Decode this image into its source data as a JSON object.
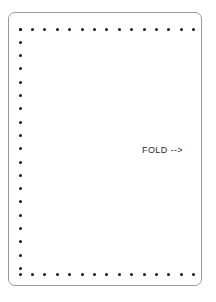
{
  "page": {
    "width": 216,
    "height": 302,
    "background_color": "#ffffff"
  },
  "sheet": {
    "name": "perforated-sheet",
    "fill_color": "#ffffff",
    "border_color": "#9a9a9a",
    "corner_radius": 7,
    "bounds": {
      "x": 8,
      "y": 12,
      "width": 194,
      "height": 274
    }
  },
  "annotation": {
    "fold_label": "FOLD -->",
    "color": "#2b2b2b",
    "position": {
      "x": 142,
      "y": 145
    }
  },
  "perforations": {
    "dot_color": "#1a1a1a",
    "dot_size": 3,
    "edges": {
      "top": {
        "count": 15,
        "y": 29,
        "x_start": 20,
        "x_step": 12.4
      },
      "left": {
        "count": 19,
        "x": 20,
        "y_start": 29,
        "y_step": 13.3
      },
      "bottom": {
        "count": 15,
        "y": 274,
        "x_start": 20,
        "x_step": 12.4
      },
      "right": {
        "count": 0
      }
    }
  }
}
